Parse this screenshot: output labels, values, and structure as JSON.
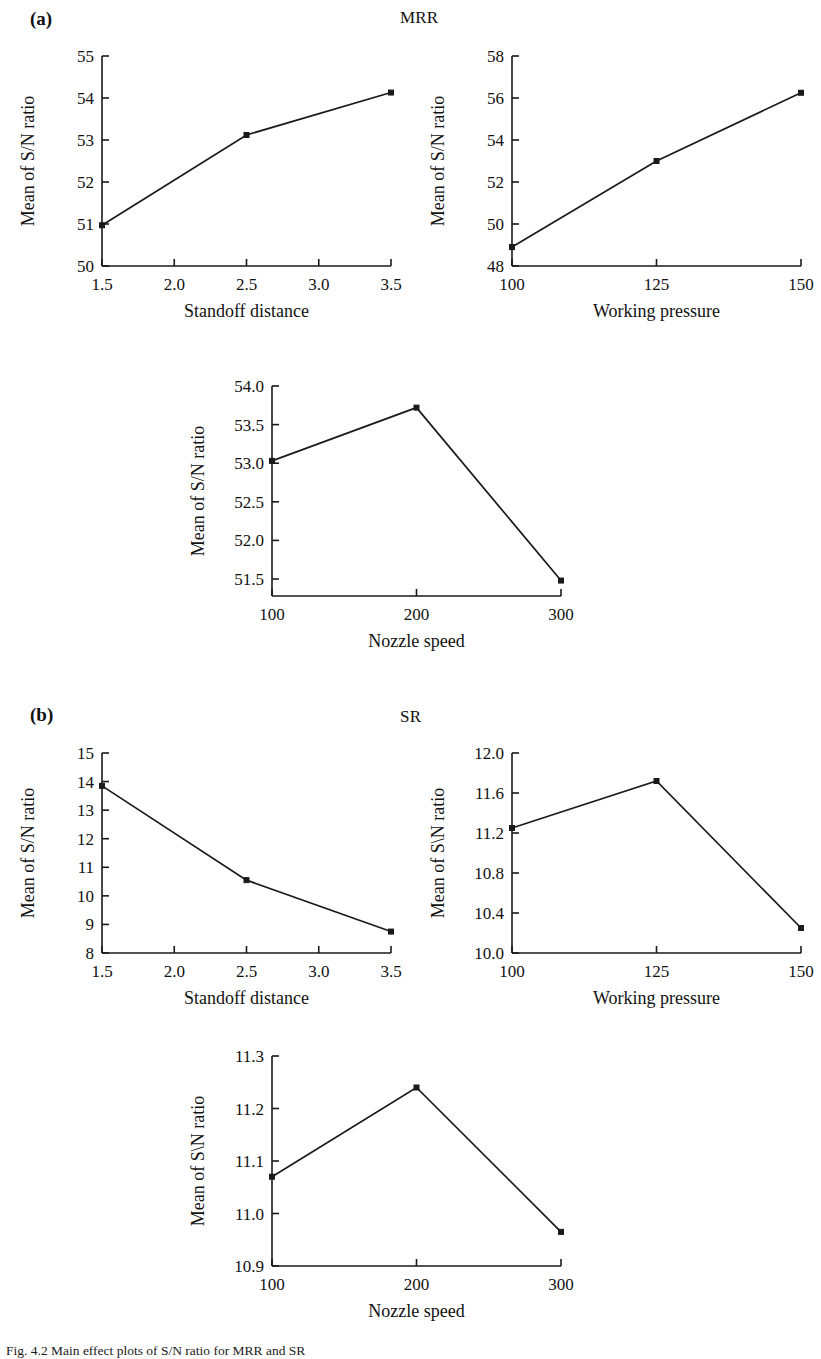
{
  "figure": {
    "caption": "Fig. 4.2  Main effect plots of S/N ratio for MRR and SR",
    "panels": [
      {
        "tag": "(a)",
        "title": "MRR"
      },
      {
        "tag": "(b)",
        "title": "SR"
      }
    ]
  },
  "chart_data": [
    {
      "id": "mrr-standoff-distance",
      "type": "line",
      "panel": "(a)",
      "group_title": "MRR",
      "title": "",
      "xlabel": "Standoff distance",
      "ylabel": "Mean of S/N ratio",
      "categories": [
        1.5,
        2.5,
        3.5
      ],
      "values": [
        50.97,
        53.12,
        54.13
      ],
      "x": [
        1.5,
        2.5,
        3.5
      ],
      "xlim": [
        1.5,
        3.5
      ],
      "ylim": [
        50,
        55
      ],
      "xticks": [
        "1.5",
        "2.0",
        "2.5",
        "3.0",
        "3.5"
      ],
      "xtick_values": [
        1.5,
        2.0,
        2.5,
        3.0,
        3.5
      ],
      "yticks": [
        "50",
        "51",
        "52",
        "53",
        "54",
        "55"
      ],
      "ytick_values": [
        50,
        51,
        52,
        53,
        54,
        55
      ],
      "grid": false,
      "legend": "none",
      "marker": "square",
      "color": "#1a1a1a"
    },
    {
      "id": "mrr-working-pressure",
      "type": "line",
      "panel": "(a)",
      "group_title": "MRR",
      "title": "",
      "xlabel": "Working pressure",
      "ylabel": "Mean of S/N ratio",
      "categories": [
        100,
        125,
        150
      ],
      "values": [
        48.9,
        53.0,
        56.25
      ],
      "x": [
        100,
        125,
        150
      ],
      "xlim": [
        100,
        150
      ],
      "ylim": [
        48,
        58
      ],
      "xticks": [
        "100",
        "125",
        "150"
      ],
      "xtick_values": [
        100,
        125,
        150
      ],
      "yticks": [
        "48",
        "50",
        "52",
        "54",
        "56",
        "58"
      ],
      "ytick_values": [
        48,
        50,
        52,
        54,
        56,
        58
      ],
      "grid": false,
      "legend": "none",
      "marker": "square",
      "color": "#1a1a1a"
    },
    {
      "id": "mrr-nozzle-speed",
      "type": "line",
      "panel": "(a)",
      "group_title": "MRR",
      "title": "",
      "xlabel": "Nozzle speed",
      "ylabel": "Mean of S/N ratio",
      "categories": [
        100,
        200,
        300
      ],
      "values": [
        53.03,
        53.72,
        51.48
      ],
      "x": [
        100,
        200,
        300
      ],
      "xlim": [
        100,
        300
      ],
      "ylim": [
        51.28,
        54.0
      ],
      "xticks": [
        "100",
        "200",
        "300"
      ],
      "xtick_values": [
        100,
        200,
        300
      ],
      "yticks": [
        "51.5",
        "52.0",
        "52.5",
        "53.0",
        "53.5",
        "54.0"
      ],
      "ytick_values": [
        51.5,
        52.0,
        52.5,
        53.0,
        53.5,
        54.0
      ],
      "grid": false,
      "legend": "none",
      "marker": "square",
      "color": "#1a1a1a"
    },
    {
      "id": "sr-standoff-distance",
      "type": "line",
      "panel": "(b)",
      "group_title": "SR",
      "title": "",
      "xlabel": "Standoff distance",
      "ylabel": "Mean of S/N ratio",
      "categories": [
        1.5,
        2.5,
        3.5
      ],
      "values": [
        13.85,
        10.55,
        8.75
      ],
      "x": [
        1.5,
        2.5,
        3.5
      ],
      "xlim": [
        1.5,
        3.5
      ],
      "ylim": [
        8,
        15
      ],
      "xticks": [
        "1.5",
        "2.0",
        "2.5",
        "3.0",
        "3.5"
      ],
      "xtick_values": [
        1.5,
        2.0,
        2.5,
        3.0,
        3.5
      ],
      "yticks": [
        "8",
        "9",
        "10",
        "11",
        "12",
        "13",
        "14",
        "15"
      ],
      "ytick_values": [
        8,
        9,
        10,
        11,
        12,
        13,
        14,
        15
      ],
      "grid": false,
      "legend": "none",
      "marker": "square",
      "color": "#1a1a1a"
    },
    {
      "id": "sr-working-pressure",
      "type": "line",
      "panel": "(b)",
      "group_title": "SR",
      "title": "",
      "xlabel": "Working pressure",
      "ylabel": "Mean of S\\N ratio",
      "categories": [
        100,
        125,
        150
      ],
      "values": [
        11.25,
        11.72,
        10.25
      ],
      "x": [
        100,
        125,
        150
      ],
      "xlim": [
        100,
        150
      ],
      "ylim": [
        10.0,
        12.0
      ],
      "xticks": [
        "100",
        "125",
        "150"
      ],
      "xtick_values": [
        100,
        125,
        150
      ],
      "yticks": [
        "10.0",
        "10.4",
        "10.8",
        "11.2",
        "11.6",
        "12.0"
      ],
      "ytick_values": [
        10.0,
        10.4,
        10.8,
        11.2,
        11.6,
        12.0
      ],
      "grid": false,
      "legend": "none",
      "marker": "square",
      "color": "#1a1a1a"
    },
    {
      "id": "sr-nozzle-speed",
      "type": "line",
      "panel": "(b)",
      "group_title": "SR",
      "title": "",
      "xlabel": "Nozzle speed",
      "ylabel": "Mean of S\\N ratio",
      "categories": [
        100,
        200,
        300
      ],
      "values": [
        11.07,
        11.24,
        10.965
      ],
      "x": [
        100,
        200,
        300
      ],
      "xlim": [
        100,
        300
      ],
      "ylim": [
        10.9,
        11.3
      ],
      "xticks": [
        "100",
        "200",
        "300"
      ],
      "xtick_values": [
        100,
        200,
        300
      ],
      "yticks": [
        "10.9",
        "11.0",
        "11.1",
        "11.2",
        "11.3"
      ],
      "ytick_values": [
        10.9,
        11.0,
        11.1,
        11.2,
        11.3
      ],
      "grid": false,
      "legend": "none",
      "marker": "square",
      "color": "#1a1a1a"
    }
  ],
  "layout": {
    "charts": [
      {
        "id": "mrr-standoff-distance",
        "left": 10,
        "top": 38,
        "width": 395,
        "height": 300
      },
      {
        "id": "mrr-working-pressure",
        "left": 420,
        "top": 38,
        "width": 395,
        "height": 300
      },
      {
        "id": "mrr-nozzle-speed",
        "left": 180,
        "top": 368,
        "width": 395,
        "height": 300
      },
      {
        "id": "sr-standoff-distance",
        "left": 10,
        "top": 735,
        "width": 395,
        "height": 290
      },
      {
        "id": "sr-working-pressure",
        "left": 420,
        "top": 735,
        "width": 395,
        "height": 290
      },
      {
        "id": "sr-nozzle-speed",
        "left": 180,
        "top": 1038,
        "width": 395,
        "height": 300
      }
    ],
    "tags": [
      {
        "label": "(a)",
        "left": 30,
        "top": 8
      },
      {
        "label": "(b)",
        "left": 30,
        "top": 704
      }
    ],
    "group_titles": [
      {
        "label": "MRR",
        "left": 400,
        "top": 8
      },
      {
        "label": "SR",
        "left": 400,
        "top": 707
      }
    ],
    "caption_top": 1343
  }
}
